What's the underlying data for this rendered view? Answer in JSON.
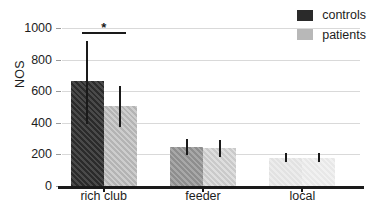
{
  "chart_data": {
    "type": "bar",
    "title": "",
    "xlabel": "",
    "ylabel": "NOS",
    "ylim": [
      0,
      1000
    ],
    "yticks": [
      0,
      200,
      400,
      600,
      800,
      1000
    ],
    "ytick_labels": [
      "0",
      "200",
      "400",
      "600",
      "800",
      "1000"
    ],
    "grid": "horizontal",
    "legend_position": "top-right",
    "categories": [
      "rich club",
      "feeder",
      "local"
    ],
    "series": [
      {
        "name": "controls",
        "color": "#2a2a2a",
        "values": [
          665,
          245,
          180
        ],
        "err_low": [
          395,
          195,
          150
        ],
        "err_high": [
          920,
          295,
          210
        ]
      },
      {
        "name": "patients",
        "color": "#b8b8b8",
        "values": [
          505,
          240,
          180
        ],
        "err_low": [
          375,
          185,
          150
        ],
        "err_high": [
          630,
          292,
          212
        ]
      }
    ],
    "annotations": [
      {
        "type": "significance",
        "label": "*",
        "between": [
          "rich club controls",
          "rich club patients"
        ],
        "y": 1000
      }
    ]
  },
  "legend": {
    "items": [
      {
        "label": "controls",
        "swatch": "#2a2a2a"
      },
      {
        "label": "patients",
        "swatch": "#b8b8b8"
      }
    ]
  },
  "axes": {
    "y_label": "NOS"
  }
}
